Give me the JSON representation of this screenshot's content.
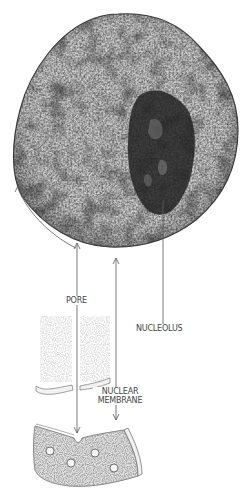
{
  "figure": {
    "labels": {
      "pore": "PORE",
      "nucleolus": "NUCLEOLUS",
      "nuclear_membrane_line1": "NUCLEAR",
      "nuclear_membrane_line2": "MEMBRANE"
    },
    "colors": {
      "background": "#ffffff",
      "nucleus_light": "#c8c8c8",
      "nucleus_dark": "#3a3a3a",
      "nucleolus": "#1e1e1e",
      "leader_line": "#555555",
      "label_text": "#444444",
      "membrane_fill": "#eeeeee"
    }
  }
}
